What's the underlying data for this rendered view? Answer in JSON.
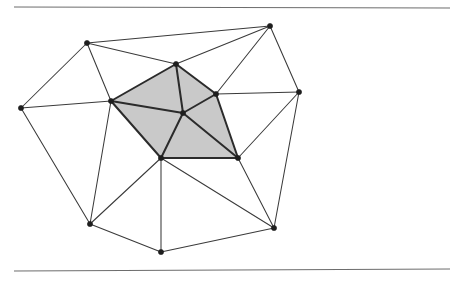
{
  "figure": {
    "background_color": "#ffffff",
    "canvas": {
      "width": 461,
      "height": 286
    },
    "shading": {
      "fill_color": "#c9c9c9",
      "description": "shaded pentagonal star of five triangles around the central hub vertex"
    },
    "edge_colors": {
      "mesh": "#3a3a3a",
      "star": "#2b2b2b",
      "rule": "#6d6d6d"
    },
    "vertex_color": "#1e1e1e",
    "vertex_radius": 2.6,
    "rules": [
      {
        "name": "top-rule",
        "x1": 14,
        "y1": 7,
        "x2": 450,
        "y2": 8
      },
      {
        "name": "bottom-rule",
        "x1": 14,
        "y1": 271,
        "x2": 450,
        "y2": 269
      }
    ],
    "vertices": [
      {
        "id": "hub",
        "label": "central hub vertex",
        "x": 183,
        "y": 113,
        "ring": "center"
      },
      {
        "id": "p-left",
        "label": "star vertex left",
        "x": 111,
        "y": 101,
        "ring": "star"
      },
      {
        "id": "p-top",
        "label": "star vertex top",
        "x": 176,
        "y": 64,
        "ring": "star"
      },
      {
        "id": "p-right",
        "label": "star vertex right",
        "x": 216,
        "y": 94,
        "ring": "star"
      },
      {
        "id": "p-lowright",
        "label": "star vertex lower right",
        "x": 238,
        "y": 158,
        "ring": "star"
      },
      {
        "id": "p-lowleft",
        "label": "star vertex lower left",
        "x": 161,
        "y": 158,
        "ring": "star"
      },
      {
        "id": "o-topleft",
        "label": "outer vertex top left",
        "x": 87,
        "y": 43,
        "ring": "outer"
      },
      {
        "id": "o-topright",
        "label": "outer vertex top right",
        "x": 270,
        "y": 26,
        "ring": "outer"
      },
      {
        "id": "o-right",
        "label": "outer vertex right",
        "x": 299,
        "y": 92,
        "ring": "outer"
      },
      {
        "id": "o-botright",
        "label": "outer vertex bottom right",
        "x": 274,
        "y": 228,
        "ring": "outer"
      },
      {
        "id": "o-botleft",
        "label": "outer vertex bottom left",
        "x": 90,
        "y": 224,
        "ring": "outer"
      },
      {
        "id": "o-botmid",
        "label": "outer vertex bottom mid",
        "x": 161,
        "y": 252,
        "ring": "outer"
      },
      {
        "id": "o-left",
        "label": "outer vertex left",
        "x": 21,
        "y": 108,
        "ring": "outer"
      }
    ],
    "shaded_faces": [
      {
        "name": "star-triangle-1",
        "vertices": [
          "hub",
          "p-left",
          "p-top"
        ]
      },
      {
        "name": "star-triangle-2",
        "vertices": [
          "hub",
          "p-top",
          "p-right"
        ]
      },
      {
        "name": "star-triangle-3",
        "vertices": [
          "hub",
          "p-right",
          "p-lowright"
        ]
      },
      {
        "name": "star-triangle-4",
        "vertices": [
          "hub",
          "p-lowright",
          "p-lowleft"
        ]
      },
      {
        "name": "star-triangle-5",
        "vertices": [
          "hub",
          "p-lowleft",
          "p-left"
        ]
      }
    ],
    "star_edges": [
      {
        "from": "hub",
        "to": "p-left"
      },
      {
        "from": "hub",
        "to": "p-top"
      },
      {
        "from": "hub",
        "to": "p-right"
      },
      {
        "from": "hub",
        "to": "p-lowright"
      },
      {
        "from": "hub",
        "to": "p-lowleft"
      },
      {
        "from": "p-left",
        "to": "p-top"
      },
      {
        "from": "p-top",
        "to": "p-right"
      },
      {
        "from": "p-right",
        "to": "p-lowright"
      },
      {
        "from": "p-lowright",
        "to": "p-lowleft"
      },
      {
        "from": "p-lowleft",
        "to": "p-left"
      }
    ],
    "mesh_edges": [
      {
        "from": "o-topleft",
        "to": "o-topright"
      },
      {
        "from": "o-topleft",
        "to": "p-top"
      },
      {
        "from": "o-topleft",
        "to": "p-left"
      },
      {
        "from": "o-topleft",
        "to": "o-left"
      },
      {
        "from": "o-topright",
        "to": "p-top"
      },
      {
        "from": "o-topright",
        "to": "p-right"
      },
      {
        "from": "o-topright",
        "to": "o-right"
      },
      {
        "from": "o-right",
        "to": "p-right"
      },
      {
        "from": "o-right",
        "to": "p-lowright"
      },
      {
        "from": "o-right",
        "to": "o-botright"
      },
      {
        "from": "o-botright",
        "to": "p-lowright"
      },
      {
        "from": "o-botright",
        "to": "p-lowleft"
      },
      {
        "from": "o-botright",
        "to": "o-botmid"
      },
      {
        "from": "o-botmid",
        "to": "p-lowleft"
      },
      {
        "from": "o-botmid",
        "to": "o-botleft"
      },
      {
        "from": "o-botleft",
        "to": "p-lowleft"
      },
      {
        "from": "o-botleft",
        "to": "p-left"
      },
      {
        "from": "o-botleft",
        "to": "o-left"
      },
      {
        "from": "o-left",
        "to": "p-left"
      }
    ]
  }
}
